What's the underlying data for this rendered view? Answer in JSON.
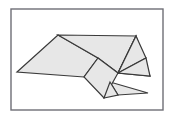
{
  "figure": {
    "canvas": {
      "width": 173,
      "height": 120
    },
    "style": {
      "background_color": "#ffffff",
      "facet_fill": "#e7e7e7",
      "facet_stroke": "#3a3a3a",
      "facet_stroke_width": 1.2,
      "frame_stroke": "#6e6e76",
      "frame_stroke_width": 1.4
    },
    "frame": {
      "x": 11,
      "y": 9,
      "width": 152,
      "height": 101
    },
    "facets": [
      {
        "name": "left-large-wing",
        "points": "17,72 58,35 98,58 84,77"
      },
      {
        "name": "upper-center-panel",
        "points": "58,35 136,36 118,73 98,58"
      },
      {
        "name": "right-upper-flap",
        "points": "136,36 146,58 118,73"
      },
      {
        "name": "right-lower-wing",
        "points": "136,36 150,76 118,73"
      },
      {
        "name": "right-mid-band",
        "points": "118,73 146,58 150,76"
      },
      {
        "name": "center-diamond",
        "points": "98,58 118,73 104,98 84,77"
      },
      {
        "name": "lower-right-tail",
        "points": "110,82 148,93 118,95"
      },
      {
        "name": "lower-center-spur",
        "points": "104,98 110,82 118,95"
      }
    ]
  }
}
